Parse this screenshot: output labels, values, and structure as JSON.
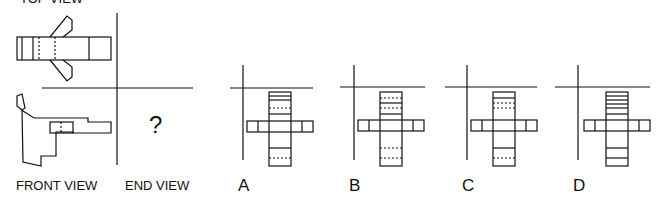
{
  "labels": {
    "top_view": "TOP VIEW",
    "front_view": "FRONT VIEW",
    "end_view": "END VIEW",
    "unknown": "?"
  },
  "options": [
    {
      "letter": "A",
      "top_lines": [
        {
          "y": 96,
          "style": "solid"
        },
        {
          "y": 100,
          "style": "solid"
        },
        {
          "y": 108,
          "style": "dotted"
        },
        {
          "y": 114,
          "style": "solid"
        }
      ],
      "bottom_lines": [
        {
          "y": 148,
          "style": "solid"
        },
        {
          "y": 158,
          "style": "dotted"
        }
      ],
      "arm_inner_lines": [
        {
          "side": "right",
          "offset": 11
        }
      ]
    },
    {
      "letter": "B",
      "top_lines": [
        {
          "y": 98,
          "style": "dotted"
        },
        {
          "y": 103,
          "style": "solid"
        },
        {
          "y": 108,
          "style": "dotted"
        },
        {
          "y": 114,
          "style": "solid"
        }
      ],
      "bottom_lines": [
        {
          "y": 148,
          "style": "dotted"
        },
        {
          "y": 158,
          "style": "dotted"
        }
      ],
      "arm_inner_lines": [
        {
          "side": "right",
          "offset": 11
        },
        {
          "side": "left",
          "offset": 11
        }
      ]
    },
    {
      "letter": "C",
      "top_lines": [
        {
          "y": 98,
          "style": "solid"
        },
        {
          "y": 103,
          "style": "dotted"
        },
        {
          "y": 108,
          "style": "dotted"
        }
      ],
      "bottom_lines": [
        {
          "y": 148,
          "style": "solid"
        },
        {
          "y": 158,
          "style": "dotted"
        }
      ],
      "arm_inner_lines": [
        {
          "side": "right",
          "offset": 11
        },
        {
          "side": "left",
          "offset": 11
        }
      ]
    },
    {
      "letter": "D",
      "top_lines": [
        {
          "y": 96,
          "style": "solid"
        },
        {
          "y": 100,
          "style": "solid"
        },
        {
          "y": 104,
          "style": "solid"
        },
        {
          "y": 108,
          "style": "solid"
        },
        {
          "y": 114,
          "style": "solid"
        }
      ],
      "bottom_lines": [
        {
          "y": 148,
          "style": "solid"
        },
        {
          "y": 158,
          "style": "solid"
        }
      ],
      "arm_inner_lines": [
        {
          "side": "right",
          "offset": 11
        },
        {
          "side": "left",
          "offset": 11
        }
      ]
    }
  ],
  "colors": {
    "line": "#111111",
    "background": "#ffffff"
  }
}
